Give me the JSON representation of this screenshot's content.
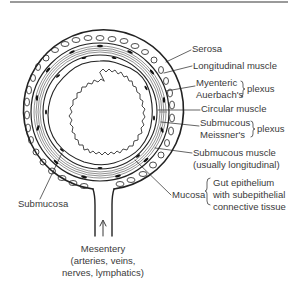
{
  "figure": {
    "labels": {
      "serosa": "Serosa",
      "longitudinal_muscle": "Longitudinal muscle",
      "myenteric": "Myenteric",
      "auerbachs": "Auerbach's",
      "plexus_1": "plexus",
      "circular_muscle": "Circular muscle",
      "submucous": "Submucous",
      "meissners": "Meissner's",
      "plexus_2": "plexus",
      "submucous_muscle": "Submucous muscle",
      "submucous_muscle_note": "(usually longitudinal)",
      "mucosa": "Mucosa",
      "mucosa_desc_1": "Gut epithelium",
      "mucosa_desc_2": "with subepithelial",
      "mucosa_desc_3": "connective tissue",
      "submucosa": "Submucosa",
      "mesentery": "Mesentery",
      "mesentery_desc_1": "(arteries, veins,",
      "mesentery_desc_2": "nerves, lymphatics)"
    },
    "colors": {
      "ink": "#222222",
      "text": "#3a3a3a",
      "rule": "#9a9a9a",
      "background": "#ffffff"
    }
  }
}
